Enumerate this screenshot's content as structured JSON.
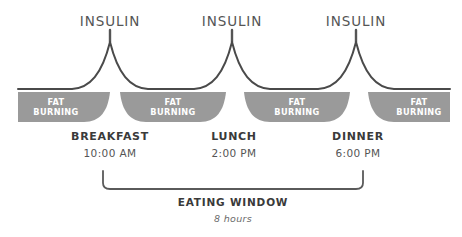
{
  "diagram": {
    "colors": {
      "curve": "#4a4a4a",
      "fat_block": "#9a9a9a",
      "fat_label": "#ffffff",
      "text": "#3a3a3a",
      "bracket": "#5a5a5a",
      "background": "#ffffff"
    },
    "insulin_spikes": [
      {
        "label": "INSULIN",
        "x": 110
      },
      {
        "label": "INSULIN",
        "x": 232
      },
      {
        "label": "INSULIN",
        "x": 356
      }
    ],
    "fat_burning_blocks": [
      {
        "line1": "FAT",
        "line2": "BURNING",
        "cx": 56
      },
      {
        "line1": "FAT",
        "line2": "BURNING",
        "cx": 172
      },
      {
        "line1": "FAT",
        "line2": "BURNING",
        "cx": 296
      },
      {
        "line1": "FAT",
        "line2": "BURNING",
        "cx": 421
      }
    ],
    "meals": [
      {
        "name": "BREAKFAST",
        "time": "10:00 AM",
        "x": 110
      },
      {
        "name": "LUNCH",
        "time": "2:00 PM",
        "x": 234
      },
      {
        "name": "DINNER",
        "time": "6:00 PM",
        "x": 358
      }
    ],
    "eating_window": {
      "title": "EATING WINDOW",
      "duration": "8 hours",
      "start_x": 103,
      "end_x": 363,
      "center_x": 233
    }
  }
}
